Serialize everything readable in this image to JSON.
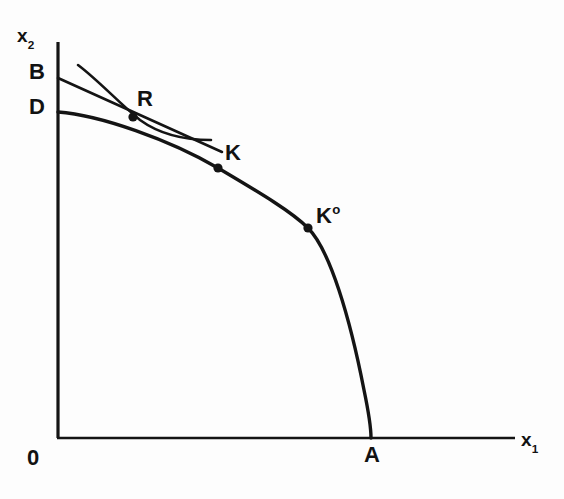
{
  "figure": {
    "background_color": "#fdfdfd",
    "ink_color": "#141414"
  },
  "axes": {
    "y_label_base": "x",
    "y_label_sub": "2",
    "x_label_base": "x",
    "x_label_sub": "1",
    "origin_label": "0",
    "x_axis": {
      "x_start": 58,
      "x_end": 515,
      "y": 438
    },
    "y_axis": {
      "y_start": 42,
      "y_end": 438,
      "x": 58
    }
  },
  "labels": {
    "b": "B",
    "d": "D",
    "a": "A",
    "r": "R",
    "k": "K",
    "k0_base": "K",
    "k0_sup": "o"
  },
  "points": [
    {
      "name": "R",
      "x": 133,
      "y": 117,
      "radius": 4.6
    },
    {
      "name": "K",
      "x": 218,
      "y": 168,
      "radius": 4.6
    },
    {
      "name": "K0",
      "x": 308,
      "y": 228,
      "radius": 4.6
    }
  ],
  "curves": {
    "ppf": {
      "name": "production-possibility-frontier",
      "from_label": "D",
      "to_label": "A",
      "stroke_width": 3.4,
      "path": "M 58 112 C 100 115 170 140 218 168 C 262 194 292 212 308 228 C 330 250 350 318 364 390 C 369 414 371 430 371 438"
    },
    "budget_line": {
      "name": "budget-line",
      "from_label": "B",
      "tangent_at": "R",
      "stroke_width": 2.6,
      "path": "M 58 78 L 222 152"
    },
    "indifference_curve": {
      "name": "indifference-curve",
      "tangent_at": "R",
      "stroke_width": 2.6,
      "path": "M 78 65 C 98 80 118 102 140 120 C 162 136 188 140 211 140"
    }
  }
}
